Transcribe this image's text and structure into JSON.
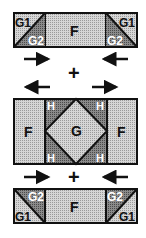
{
  "diagram": {
    "colors": {
      "light": "#cfcfcf",
      "medium": "#a8a8a8",
      "dark": "#7a7a7a",
      "line": "#111111",
      "white_text": "#ffffff"
    },
    "top_row": {
      "left_unit": {
        "top_label": "G1",
        "bottom_label": "G2"
      },
      "center_label": "F",
      "right_unit": {
        "top_label": "G1",
        "bottom_label": "G2"
      }
    },
    "operator_1": "+",
    "middle_row": {
      "left_label": "F",
      "center_label": "G",
      "corner_labels": [
        "H",
        "H",
        "H",
        "H"
      ],
      "right_label": "F"
    },
    "operator_2": "+",
    "bottom_row": {
      "left_unit": {
        "top_label": "G2",
        "bottom_label": "G1"
      },
      "center_label": "F",
      "right_unit": {
        "top_label": "G2",
        "bottom_label": "G1"
      }
    },
    "arrows": {
      "top": [
        "right",
        "left"
      ],
      "middle": [
        "left",
        "right"
      ],
      "bottom": [
        "right",
        "left"
      ]
    }
  }
}
